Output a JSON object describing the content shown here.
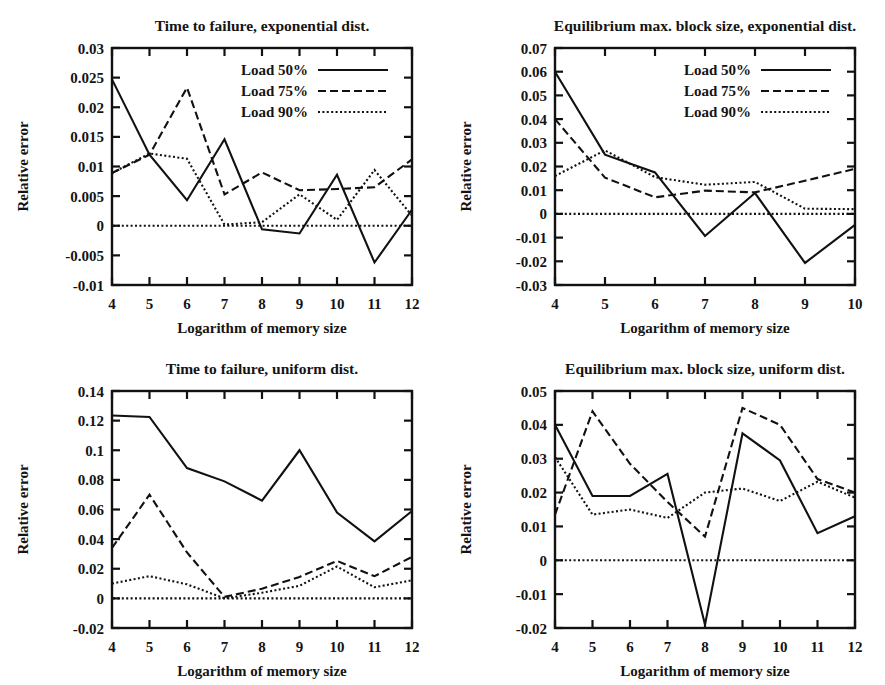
{
  "figure": {
    "background": "#ffffff",
    "ink": "#111111",
    "panel_count": 4
  },
  "common": {
    "ylabel": "Relative error",
    "xlabel": "Logarithm of memory size",
    "legend": [
      {
        "label": "Load 50%",
        "style": "solid"
      },
      {
        "label": "Load 75%",
        "style": "dashed"
      },
      {
        "label": "Load 90%",
        "style": "dotted"
      }
    ]
  },
  "chart_data": [
    {
      "id": "time-to-failure-exponential",
      "type": "line",
      "title": "Time to failure, exponential dist.",
      "xlabel": "Logarithm of memory size",
      "ylabel": "Relative error",
      "x": [
        4,
        5,
        6,
        7,
        8,
        9,
        10,
        11,
        12
      ],
      "xlim": [
        4,
        12
      ],
      "xticks": [
        4,
        5,
        6,
        7,
        8,
        9,
        10,
        11,
        12
      ],
      "xticklabels": [
        "4",
        "5",
        "6",
        "7",
        "8",
        "9",
        "10",
        "11",
        "12"
      ],
      "ylim": [
        -0.01,
        0.03
      ],
      "yticks": [
        -0.01,
        -0.005,
        0,
        0.005,
        0.01,
        0.015,
        0.02,
        0.025,
        0.03
      ],
      "yticklabels": [
        "-0.01",
        "-0.005",
        "0",
        "0.005",
        "0.01",
        "0.015",
        "0.02",
        "0.025",
        "0.03"
      ],
      "grid": false,
      "legend_position": "top-right",
      "series": [
        {
          "name": "Load 50%",
          "style": "solid",
          "values": [
            0.0247,
            0.012,
            0.0043,
            0.0146,
            -0.0006,
            -0.0013,
            0.0086,
            -0.0062,
            0.0027
          ]
        },
        {
          "name": "Load 75%",
          "style": "dashed",
          "values": [
            0.0089,
            0.012,
            0.0233,
            0.0053,
            0.009,
            0.006,
            0.0062,
            0.0065,
            0.0112
          ]
        },
        {
          "name": "Load 90%",
          "style": "dotted",
          "values": [
            0.0089,
            0.0122,
            0.0113,
            0.0002,
            0.0006,
            0.0053,
            0.001,
            0.0094,
            0.0017
          ]
        }
      ]
    },
    {
      "id": "equilibrium-max-block-size-exponential",
      "type": "line",
      "title": "Equilibrium max. block size, exponential dist.",
      "xlabel": "Logarithm of memory size",
      "ylabel": "Relative error",
      "x": [
        4,
        5,
        6,
        7,
        8,
        9,
        10
      ],
      "xlim": [
        4,
        10
      ],
      "xticks": [
        4,
        5,
        6,
        7,
        8,
        9,
        10
      ],
      "xticklabels": [
        "4",
        "5",
        "6",
        "7",
        "8",
        "9",
        "10"
      ],
      "ylim": [
        -0.03,
        0.07
      ],
      "yticks": [
        -0.03,
        -0.02,
        -0.01,
        0,
        0.01,
        0.02,
        0.03,
        0.04,
        0.05,
        0.06,
        0.07
      ],
      "yticklabels": [
        "-0.03",
        "-0.02",
        "-0.01",
        "0",
        "0.01",
        "0.02",
        "0.03",
        "0.04",
        "0.05",
        "0.06",
        "0.07"
      ],
      "grid": false,
      "legend_position": "top-right",
      "series": [
        {
          "name": "Load 50%",
          "style": "solid",
          "values": [
            0.06,
            0.025,
            0.0175,
            -0.0093,
            0.0088,
            -0.0207,
            -0.0046
          ]
        },
        {
          "name": "Load 75%",
          "style": "dashed",
          "values": [
            0.04,
            0.0153,
            0.007,
            0.0098,
            0.0091,
            0.014,
            0.019
          ]
        },
        {
          "name": "Load 90%",
          "style": "dotted",
          "values": [
            0.016,
            0.0268,
            0.0155,
            0.0123,
            0.0135,
            0.0022,
            0.002
          ]
        }
      ]
    },
    {
      "id": "time-to-failure-uniform",
      "type": "line",
      "title": "Time to failure, uniform dist.",
      "xlabel": "Logarithm of memory size",
      "ylabel": "Relative error",
      "x": [
        4,
        5,
        6,
        7,
        8,
        9,
        10,
        11,
        12
      ],
      "xlim": [
        4,
        12
      ],
      "xticks": [
        4,
        5,
        6,
        7,
        8,
        9,
        10,
        11,
        12
      ],
      "xticklabels": [
        "4",
        "5",
        "6",
        "7",
        "8",
        "9",
        "10",
        "11",
        "12"
      ],
      "ylim": [
        -0.02,
        0.14
      ],
      "yticks": [
        -0.02,
        0,
        0.02,
        0.04,
        0.06,
        0.08,
        0.1,
        0.12,
        0.14
      ],
      "yticklabels": [
        "-0.02",
        "0",
        "0.02",
        "0.04",
        "0.06",
        "0.08",
        "0.1",
        "0.12",
        "0.14"
      ],
      "grid": false,
      "legend_position": "none",
      "series": [
        {
          "name": "Load 50%",
          "style": "solid",
          "values": [
            0.1235,
            0.1225,
            0.088,
            0.079,
            0.066,
            0.1,
            0.058,
            0.0385,
            0.059
          ]
        },
        {
          "name": "Load 75%",
          "style": "dashed",
          "values": [
            0.034,
            0.07,
            0.031,
            0.001,
            0.0065,
            0.0145,
            0.0253,
            0.015,
            0.028
          ]
        },
        {
          "name": "Load 90%",
          "style": "dotted",
          "values": [
            0.01,
            0.015,
            0.0095,
            0.0,
            0.0038,
            0.0085,
            0.0215,
            0.0075,
            0.0122
          ]
        }
      ]
    },
    {
      "id": "equilibrium-max-block-size-uniform",
      "type": "line",
      "title": "Equilibrium max. block size, uniform dist.",
      "xlabel": "Logarithm of memory size",
      "ylabel": "Relative error",
      "x": [
        4,
        5,
        6,
        7,
        8,
        9,
        10,
        11,
        12
      ],
      "xlim": [
        4,
        12
      ],
      "xticks": [
        4,
        5,
        6,
        7,
        8,
        9,
        10,
        11,
        12
      ],
      "xticklabels": [
        "4",
        "5",
        "6",
        "7",
        "8",
        "9",
        "10",
        "11",
        "12"
      ],
      "ylim": [
        -0.02,
        0.05
      ],
      "yticks": [
        -0.02,
        -0.01,
        0,
        0.01,
        0.02,
        0.03,
        0.04,
        0.05
      ],
      "yticklabels": [
        "-0.02",
        "-0.01",
        "0",
        "0.01",
        "0.02",
        "0.03",
        "0.04",
        "0.05"
      ],
      "grid": false,
      "legend_position": "none",
      "series": [
        {
          "name": "Load 50%",
          "style": "solid",
          "values": [
            0.04,
            0.019,
            0.019,
            0.0255,
            -0.019,
            0.0375,
            0.0295,
            0.008,
            0.013
          ]
        },
        {
          "name": "Load 75%",
          "style": "dashed",
          "values": [
            0.0135,
            0.044,
            0.0285,
            0.0172,
            0.007,
            0.045,
            0.04,
            0.024,
            0.02
          ]
        },
        {
          "name": "Load 90%",
          "style": "dotted",
          "values": [
            0.0305,
            0.0135,
            0.015,
            0.0125,
            0.02,
            0.0212,
            0.0175,
            0.0232,
            0.0185
          ]
        }
      ]
    }
  ]
}
